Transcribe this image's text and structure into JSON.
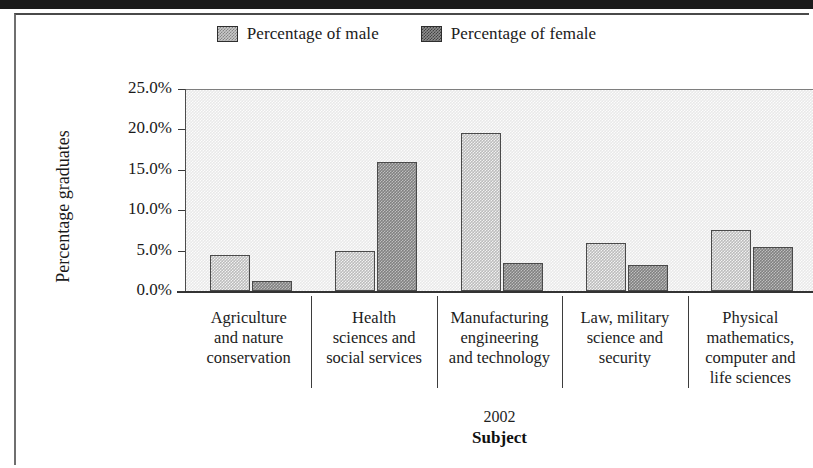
{
  "chart_data": {
    "type": "bar",
    "title": "",
    "xlabel": "Subject",
    "ylabel": "Percentage graduates",
    "year_note": "2002",
    "categories": [
      "Agriculture and nature conservation",
      "Health sciences and social services",
      "Manufacturing engineering and technology",
      "Law, military science and security",
      "Physical mathematics, computer and life sciences"
    ],
    "category_lines": [
      [
        "Agriculture",
        "and nature",
        "conservation"
      ],
      [
        "Health",
        "sciences and",
        "social services"
      ],
      [
        "Manufacturing",
        "engineering",
        "and technology"
      ],
      [
        "Law, military",
        "science and",
        "security"
      ],
      [
        "Physical",
        "mathematics,",
        "computer and",
        "life sciences"
      ]
    ],
    "series": [
      {
        "name": "Percentage of male",
        "values": [
          4.4,
          5.0,
          19.6,
          5.9,
          7.5
        ]
      },
      {
        "name": "Percentage of female",
        "values": [
          1.2,
          16.0,
          3.5,
          3.2,
          5.5
        ]
      }
    ],
    "ylim": [
      0,
      25
    ],
    "yticks": [
      0,
      5,
      10,
      15,
      20,
      25
    ],
    "ytick_labels": [
      "0.0%",
      "5.0%",
      "10.0%",
      "15.0%",
      "20.0%",
      "25.0%"
    ],
    "grid": false,
    "legend_position": "top-center",
    "colors": {
      "male": "#bcbcbc",
      "female": "#818181",
      "plot_background": "#e9e9e9",
      "axis": "#333333",
      "text": "#1a1a1a"
    }
  },
  "legend": {
    "items": [
      {
        "label": "Percentage of male",
        "swatch": "male-swatch-icon"
      },
      {
        "label": "Percentage of female",
        "swatch": "female-swatch-icon"
      }
    ]
  },
  "axes": {
    "y_title": "Percentage graduates",
    "x_title": "Subject",
    "year": "2002",
    "y_labels": [
      "25.0%",
      "20.0%",
      "15.0%",
      "10.0%",
      "5.0%",
      "0.0%"
    ]
  }
}
